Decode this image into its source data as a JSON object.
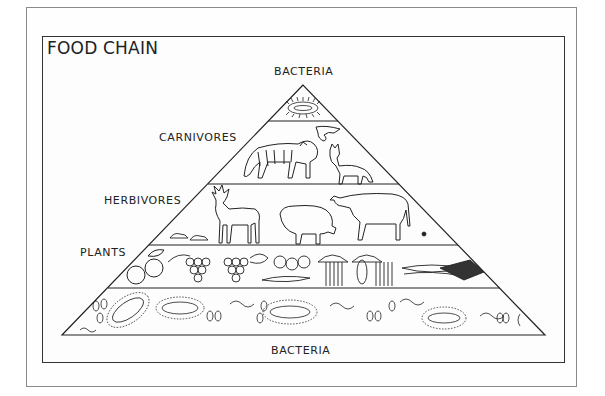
{
  "diagram": {
    "title": "FOOD CHAIN",
    "labels": {
      "top": "BACTERIA",
      "carnivores": "CARNIVORES",
      "herbivores": "HERBIVORES",
      "plants": "PLANTS",
      "bottom": "BACTERIA"
    },
    "levels": [
      {
        "name": "Bacteria (decomposers, apex)",
        "contents": [
          "bacterium colony"
        ]
      },
      {
        "name": "Carnivores",
        "contents": [
          "tiger",
          "bird of prey",
          "fox"
        ]
      },
      {
        "name": "Herbivores",
        "contents": [
          "deer",
          "pig",
          "cow",
          "mice",
          "insect"
        ]
      },
      {
        "name": "Plants",
        "contents": [
          "apple",
          "grapes",
          "vegetables",
          "wheat",
          "cabbage"
        ]
      },
      {
        "name": "Bacteria (base)",
        "contents": [
          "rod bacteria",
          "cocci",
          "spirilla",
          "ciliated bacteria"
        ]
      }
    ],
    "colors": {
      "line": "#222222",
      "frame": "#8a8a8a",
      "background": "#ffffff"
    }
  }
}
